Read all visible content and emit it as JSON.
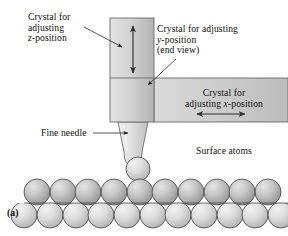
{
  "figure": {
    "panel_label": "(a)",
    "caption_context": "Scanning tunneling microscope tip positioning assembly",
    "background_color": "#ffffff",
    "ink_color": "#111111"
  },
  "labels": {
    "z_crystal": {
      "name": "crystal-z-label",
      "lines": [
        "Crystal for",
        "adjusting",
        "z-position"
      ],
      "italic_tokens": [
        "z"
      ]
    },
    "y_crystal": {
      "name": "crystal-y-label",
      "lines": [
        "Crystal for adjusting",
        "y-position",
        "(end view)"
      ],
      "italic_tokens": [
        "y"
      ]
    },
    "x_crystal": {
      "name": "crystal-x-label",
      "lines": [
        "Crystal for",
        "adjusting x-position"
      ],
      "italic_tokens": [
        "x"
      ]
    },
    "fine_needle": {
      "name": "fine-needle-label",
      "text": "Fine needle"
    },
    "surface_atoms": {
      "name": "surface-atoms-label",
      "text": "Surface atoms"
    }
  },
  "blocks": {
    "vertical_crystal": {
      "label": "z-adjusting crystal block",
      "x": 110,
      "y": 18,
      "width": 44,
      "height": 104,
      "fill_left": "#dcdcdc",
      "fill_right": "#b9b9b9",
      "stroke": "#6b6b6b"
    },
    "horizontal_crystal": {
      "label": "x-adjusting crystal block",
      "x": 154,
      "y": 78,
      "width": 134,
      "height": 44,
      "fill_left": "#d7d7d7",
      "fill_right": "#bdbdbd",
      "stroke": "#6b6b6b"
    },
    "junction_square": {
      "label": "y-adjusting crystal end view",
      "x": 110,
      "y": 78,
      "width": 44,
      "height": 44
    }
  },
  "needle": {
    "label": "fine-needle-tip",
    "top_left_x": 118,
    "top_right_x": 148,
    "top_y": 122,
    "tip_half_width": 9,
    "tip_y": 166,
    "fill_light": "#ececec",
    "fill_dark": "#c4c4c4",
    "stroke": "#6b6b6b"
  },
  "arrows": {
    "z_double_arrow": {
      "name": "vertical-double-arrow",
      "orientation": "vertical",
      "x": 133,
      "y_top": 24,
      "y_bottom": 75,
      "color": "#3d3d3d"
    },
    "x_double_arrow": {
      "name": "horizontal-double-arrow",
      "orientation": "horizontal",
      "y": 114,
      "x_left": 196,
      "x_right": 247,
      "color": "#3d3d3d"
    },
    "z_leader": {
      "name": "z-label-leader-line",
      "from_x": 84,
      "from_y": 28,
      "to_x": 123,
      "to_y": 47
    },
    "y_leader": {
      "name": "y-label-leader-line",
      "from_x": 175,
      "from_y": 60,
      "to_x": 147,
      "to_y": 86
    },
    "needle_leader": {
      "name": "fine-needle-leader-line",
      "from_x": 92,
      "from_y": 133,
      "to_x": 129,
      "to_y": 133
    }
  },
  "atoms": {
    "label": "surface atom lattice",
    "top_row": {
      "name": "atom-row-top",
      "count": 10,
      "start_x": 37,
      "spacing": 25.6,
      "center_y": 192,
      "radius": 13,
      "fill_light": "#d3d3d3",
      "fill_dark": "#9a9a9a",
      "stroke": "#4a4a4a"
    },
    "bottom_row": {
      "name": "atom-row-bottom",
      "count": 11,
      "start_x": 24,
      "spacing": 25.6,
      "center_y": 215,
      "radius": 13,
      "fill_light": "#e8e8e8",
      "fill_dark": "#b5b5b5",
      "stroke": "#4a4a4a"
    },
    "lifted_atom": {
      "name": "lifted-atom",
      "center_x": 138,
      "center_y": 168,
      "radius": 12
    },
    "baseline": {
      "name": "lattice-baseline",
      "x1": 24,
      "x2": 288,
      "y": 203
    }
  }
}
